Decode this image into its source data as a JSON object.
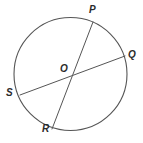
{
  "figure": {
    "type": "circle-with-two-chords",
    "stroke_color": "#555555",
    "label_color": "#2b2b2b",
    "background_color": "#ffffff",
    "circle": {
      "name": "circle-o",
      "center_x": 70.5,
      "center_y": 74,
      "radius": 56.5,
      "stroke_width": 1.1
    },
    "points": [
      {
        "id": "P",
        "label": "P",
        "x": 93,
        "y": 22,
        "on": "circle"
      },
      {
        "id": "Q",
        "label": "Q",
        "x": 125,
        "y": 56,
        "on": "circle"
      },
      {
        "id": "R",
        "label": "R",
        "x": 52,
        "y": 129,
        "on": "circle"
      },
      {
        "id": "S",
        "label": "S",
        "x": 20,
        "y": 95,
        "on": "circle"
      },
      {
        "id": "O",
        "label": "O",
        "x": 70.5,
        "y": 74,
        "on": "center"
      }
    ],
    "segments": [
      {
        "id": "PR",
        "label": "P-R",
        "x1": 93,
        "y1": 22,
        "x2": 52,
        "y2": 129
      },
      {
        "id": "QS",
        "label": "Q-S",
        "x1": 125,
        "y1": 56,
        "x2": 20,
        "y2": 95
      }
    ]
  }
}
